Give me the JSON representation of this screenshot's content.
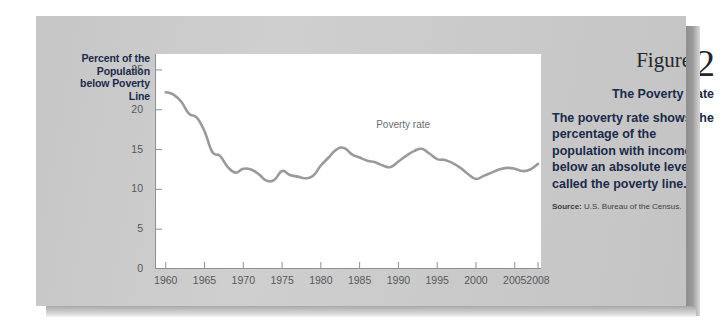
{
  "figure": {
    "heading_word": "Figure",
    "number": "2",
    "subtitle": "The Poverty Rate",
    "description": "The poverty rate shows the percentage of the population with incomes below an absolute level called the poverty line.",
    "source_label": "Source:",
    "source_text": "U.S. Bureau of the Census."
  },
  "colors": {
    "card_background": "#c9c9c9",
    "plot_background": "#ffffff",
    "series_line": "#9a9a9a",
    "axis": "#8c8f93",
    "heading_text": "#24262a",
    "body_text": "#1b2a4a",
    "tick_text": "#55585c"
  },
  "chart_data": {
    "type": "line",
    "title": "The Poverty Rate",
    "xlabel": "",
    "ylabel": "Percent of the Population below Poverty Line",
    "xlim": [
      1959,
      2008
    ],
    "ylim": [
      0,
      27
    ],
    "yticks": [
      0,
      5,
      10,
      15,
      20,
      25
    ],
    "ytick_labels": [
      "0",
      "5",
      "10",
      "15",
      "20",
      "25"
    ],
    "xticks": [
      1960,
      1965,
      1970,
      1975,
      1980,
      1985,
      1990,
      1995,
      2000,
      2005,
      2008
    ],
    "xtick_labels": [
      "1960",
      "1965",
      "1970",
      "1975",
      "1980",
      "1985",
      "1990",
      "1995",
      "2000",
      "2005",
      "2008"
    ],
    "grid": false,
    "legend": "none",
    "annotations": [
      {
        "text": "Poverty rate",
        "x": 1991,
        "y": 18.0
      }
    ],
    "series": [
      {
        "name": "Poverty rate",
        "x": [
          1960,
          1961,
          1962,
          1963,
          1964,
          1965,
          1966,
          1967,
          1968,
          1969,
          1970,
          1971,
          1972,
          1973,
          1974,
          1975,
          1976,
          1977,
          1978,
          1979,
          1980,
          1981,
          1982,
          1983,
          1984,
          1985,
          1986,
          1987,
          1988,
          1989,
          1990,
          1991,
          1992,
          1993,
          1994,
          1995,
          1996,
          1997,
          1998,
          1999,
          2000,
          2001,
          2002,
          2003,
          2004,
          2005,
          2006,
          2007,
          2008
        ],
        "values": [
          22.2,
          21.9,
          21.0,
          19.5,
          19.0,
          17.3,
          14.7,
          14.2,
          12.8,
          12.1,
          12.6,
          12.5,
          11.9,
          11.1,
          11.2,
          12.3,
          11.8,
          11.6,
          11.4,
          11.7,
          13.0,
          14.0,
          15.0,
          15.2,
          14.4,
          14.0,
          13.6,
          13.4,
          13.0,
          12.8,
          13.5,
          14.2,
          14.8,
          15.1,
          14.5,
          13.8,
          13.7,
          13.3,
          12.7,
          11.9,
          11.3,
          11.7,
          12.1,
          12.5,
          12.7,
          12.6,
          12.3,
          12.5,
          13.2
        ]
      }
    ]
  }
}
